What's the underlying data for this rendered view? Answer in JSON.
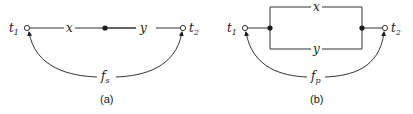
{
  "diagram_a": {
    "caption": "(a)",
    "terminal_left": "t",
    "terminal_left_sub": "1",
    "terminal_right": "t",
    "terminal_right_sub": "2",
    "edge_x": "x",
    "edge_y": "y",
    "arc_label": "f",
    "arc_label_sub": "s"
  },
  "diagram_b": {
    "caption": "(b)",
    "terminal_left": "t",
    "terminal_left_sub": "1",
    "terminal_right": "t",
    "terminal_right_sub": "2",
    "edge_x": "x",
    "edge_y": "y",
    "arc_label": "f",
    "arc_label_sub": "p"
  },
  "colors": {
    "stroke": "#333333",
    "fill": "#1a1a1a",
    "background": "#ffffff"
  }
}
